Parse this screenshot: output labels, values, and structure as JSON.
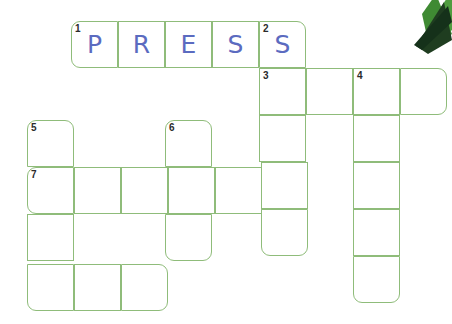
{
  "puzzle": {
    "type": "crossword-grid",
    "grid_color": "#8fbc7a",
    "letter_color": "#5b6bc0",
    "number_color": "#2b2b2b",
    "background": "#ffffff",
    "cell_size": 47,
    "filled_word": "PRESS",
    "clue_numbers": [
      "1",
      "2",
      "3",
      "4",
      "5",
      "6",
      "7"
    ],
    "entries": [
      {
        "number": "1",
        "direction": "across",
        "length": 5,
        "letters": [
          "P",
          "R",
          "E",
          "S",
          "S"
        ]
      },
      {
        "number": "2",
        "direction": "down",
        "length": 5,
        "letters": [
          "S",
          "",
          "",
          "",
          ""
        ]
      },
      {
        "number": "3",
        "direction": "across",
        "length": 4,
        "letters": [
          "",
          "",
          "",
          ""
        ]
      },
      {
        "number": "4",
        "direction": "down",
        "length": 5,
        "letters": [
          "",
          "",
          "",
          "",
          ""
        ]
      },
      {
        "number": "5",
        "direction": "down",
        "length": 4,
        "letters": [
          "",
          "",
          "",
          ""
        ]
      },
      {
        "number": "6",
        "direction": "down",
        "length": 3,
        "letters": [
          "",
          "",
          ""
        ]
      },
      {
        "number": "7",
        "direction": "across",
        "length": 6,
        "letters": [
          "",
          "",
          "",
          "",
          "",
          ""
        ]
      }
    ],
    "cells": [
      {
        "name": "cell-r0c0",
        "x": 71,
        "y": 21,
        "num": "1",
        "letter": "P",
        "round": [
          "tl",
          "bl"
        ]
      },
      {
        "name": "cell-r0c1",
        "x": 118,
        "y": 21,
        "num": "",
        "letter": "R",
        "round": []
      },
      {
        "name": "cell-r0c2",
        "x": 165,
        "y": 21,
        "num": "",
        "letter": "E",
        "round": []
      },
      {
        "name": "cell-r0c3",
        "x": 212,
        "y": 21,
        "num": "",
        "letter": "S",
        "round": []
      },
      {
        "name": "cell-r0c4",
        "x": 259,
        "y": 21,
        "num": "2",
        "letter": "S",
        "round": [
          "tr"
        ]
      },
      {
        "name": "cell-r1c4",
        "x": 259,
        "y": 68,
        "num": "3",
        "letter": "",
        "round": []
      },
      {
        "name": "cell-r1c5",
        "x": 306,
        "y": 68,
        "num": "",
        "letter": "",
        "round": []
      },
      {
        "name": "cell-r1c6",
        "x": 353,
        "y": 68,
        "num": "4",
        "letter": "",
        "round": []
      },
      {
        "name": "cell-r1c7",
        "x": 400,
        "y": 68,
        "num": "",
        "letter": "",
        "round": [
          "tr",
          "br"
        ]
      },
      {
        "name": "cell-r2c4",
        "x": 259,
        "y": 115,
        "num": "",
        "letter": "",
        "round": []
      },
      {
        "name": "cell-r2c6",
        "x": 353,
        "y": 115,
        "num": "",
        "letter": "",
        "round": []
      },
      {
        "name": "cell-r2c0",
        "x": 27,
        "y": 120,
        "num": "5",
        "letter": "",
        "round": [
          "tl",
          "tr"
        ]
      },
      {
        "name": "cell-r2c2",
        "x": 165,
        "y": 120,
        "num": "6",
        "letter": "",
        "round": [
          "tl",
          "tr"
        ]
      },
      {
        "name": "cell-r3c0",
        "x": 27,
        "y": 167,
        "num": "7",
        "letter": "",
        "round": [
          "tl",
          "bl"
        ]
      },
      {
        "name": "cell-r3c1",
        "x": 74,
        "y": 167,
        "num": "",
        "letter": "",
        "round": []
      },
      {
        "name": "cell-r3c2",
        "x": 121,
        "y": 167,
        "num": "",
        "letter": "",
        "round": []
      },
      {
        "name": "cell-r3c3",
        "x": 168,
        "y": 167,
        "num": "",
        "letter": "",
        "round": []
      },
      {
        "name": "cell-r3c4",
        "x": 215,
        "y": 167,
        "num": "",
        "letter": "",
        "round": []
      },
      {
        "name": "cell-r3c5",
        "x": 261,
        "y": 162,
        "num": "",
        "letter": "",
        "round": []
      },
      {
        "name": "cell-r3c6",
        "x": 353,
        "y": 162,
        "num": "",
        "letter": "",
        "round": []
      },
      {
        "name": "cell-r4c0",
        "x": 27,
        "y": 214,
        "num": "",
        "letter": "",
        "round": []
      },
      {
        "name": "cell-r4c2",
        "x": 165,
        "y": 214,
        "num": "",
        "letter": "",
        "round": [
          "bl",
          "br"
        ]
      },
      {
        "name": "cell-r4c5",
        "x": 261,
        "y": 209,
        "num": "",
        "letter": "",
        "round": [
          "bl",
          "br"
        ]
      },
      {
        "name": "cell-r4c6",
        "x": 353,
        "y": 209,
        "num": "",
        "letter": "",
        "round": []
      },
      {
        "name": "cell-r5c0",
        "x": 27,
        "y": 264,
        "num": "",
        "letter": "",
        "round": [
          "bl"
        ]
      },
      {
        "name": "cell-r5c1",
        "x": 74,
        "y": 264,
        "num": "",
        "letter": "",
        "round": []
      },
      {
        "name": "cell-r5c2",
        "x": 121,
        "y": 264,
        "num": "",
        "letter": "",
        "round": [
          "tr",
          "br"
        ]
      },
      {
        "name": "cell-r5c6",
        "x": 353,
        "y": 256,
        "num": "",
        "letter": "",
        "round": [
          "bl",
          "br"
        ]
      }
    ]
  }
}
